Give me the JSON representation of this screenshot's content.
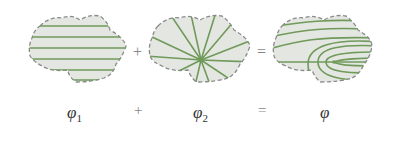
{
  "figure": {
    "panels": [
      {
        "name": "phi1",
        "description": "uniform flow (parallel horizontal streamlines)",
        "label_symbol": "φ",
        "label_sub": "1"
      },
      {
        "name": "phi2",
        "description": "source flow (radial streamlines from center)",
        "label_symbol": "φ",
        "label_sub": "2"
      },
      {
        "name": "phi",
        "description": "superposition: flow past a half-body (Rankine)",
        "label_symbol": "φ",
        "label_sub": ""
      }
    ],
    "operators": {
      "plus": "+",
      "equals": "="
    },
    "colors": {
      "region_fill": "#e4e6e2",
      "boundary": "#8a8a8a",
      "streamline": "#6f9a5a",
      "text": "#333333"
    }
  }
}
